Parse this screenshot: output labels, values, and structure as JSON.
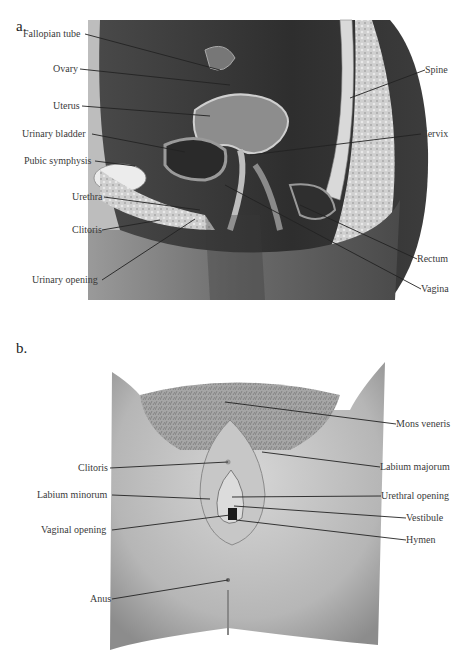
{
  "figure": {
    "panel_a": {
      "letter": "a.",
      "title": "Sagittal section of female pelvis",
      "left_labels": [
        {
          "text": "Fallopian tube",
          "x": 23,
          "y": 30,
          "tx": 220,
          "ty": 70
        },
        {
          "text": "Ovary",
          "x": 53,
          "y": 65,
          "tx": 230,
          "ty": 85
        },
        {
          "text": "Uterus",
          "x": 53,
          "y": 102,
          "tx": 210,
          "ty": 116
        },
        {
          "text": "Urinary bladder",
          "x": 22,
          "y": 130,
          "tx": 185,
          "ty": 152
        },
        {
          "text": "Pubic symphysis",
          "x": 24,
          "y": 157,
          "tx": 135,
          "ty": 166
        },
        {
          "text": "Urethra",
          "x": 72,
          "y": 193,
          "tx": 200,
          "ty": 210
        },
        {
          "text": "Clitoris",
          "x": 72,
          "y": 226,
          "tx": 160,
          "ty": 220
        },
        {
          "text": "Urinary opening",
          "x": 32,
          "y": 276,
          "tx": 195,
          "ty": 219
        }
      ],
      "right_labels": [
        {
          "text": "Spine",
          "x": 425,
          "y": 66,
          "tx": 350,
          "ty": 98
        },
        {
          "text": "Cervix",
          "x": 421,
          "y": 130,
          "tx": 250,
          "ty": 155
        },
        {
          "text": "Rectum",
          "x": 417,
          "y": 255,
          "tx": 300,
          "ty": 205
        },
        {
          "text": "Vagina",
          "x": 421,
          "y": 285,
          "tx": 225,
          "ty": 185
        }
      ]
    },
    "panel_b": {
      "letter": "b.",
      "title": "External female genitalia",
      "left_labels": [
        {
          "text": "Clitoris",
          "x": 78,
          "y": 460,
          "tx": 228,
          "ty": 462
        },
        {
          "text": "Labium minorum",
          "x": 37,
          "y": 491,
          "tx": 210,
          "ty": 499
        },
        {
          "text": "Vaginal opening",
          "x": 41,
          "y": 526,
          "tx": 230,
          "ty": 515
        },
        {
          "text": "Anus",
          "x": 90,
          "y": 595,
          "tx": 228,
          "ty": 580
        }
      ],
      "right_labels": [
        {
          "text": "Mons veneris",
          "x": 396,
          "y": 420,
          "tx": 225,
          "ty": 402
        },
        {
          "text": "Labium majorum",
          "x": 380,
          "y": 463,
          "tx": 262,
          "ty": 452
        },
        {
          "text": "Urethral opening",
          "x": 381,
          "y": 492,
          "tx": 232,
          "ty": 497
        },
        {
          "text": "Vestibule",
          "x": 406,
          "y": 514,
          "tx": 234,
          "ty": 506
        },
        {
          "text": "Hymen",
          "x": 406,
          "y": 536,
          "tx": 236,
          "ty": 520
        }
      ]
    }
  }
}
